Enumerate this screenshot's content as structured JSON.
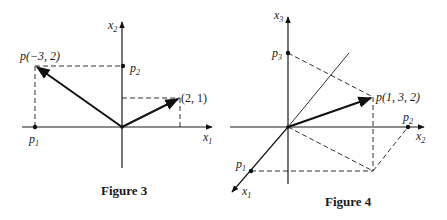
{
  "figure3": {
    "caption": "Figure 3",
    "axes": {
      "horizontal": "x",
      "horizontal_sub": "1",
      "vertical": "x",
      "vertical_sub": "2"
    },
    "points": {
      "p_label": "p(−3, 2)",
      "q_label": "(2, 1)",
      "p1": "p",
      "p1_sub": "1",
      "p2": "p",
      "p2_sub": "2"
    },
    "vectors": [
      {
        "from": [
          0,
          0
        ],
        "to": [
          -3,
          2
        ]
      },
      {
        "from": [
          0,
          0
        ],
        "to": [
          2,
          1
        ]
      }
    ]
  },
  "figure4": {
    "caption": "Figure 4",
    "axes": {
      "x1": "x",
      "x1_sub": "1",
      "x2": "x",
      "x2_sub": "2",
      "x3": "x",
      "x3_sub": "3"
    },
    "points": {
      "p_label": "p(1, 3, 2)",
      "p1": "p",
      "p1_sub": "1",
      "p2": "p",
      "p2_sub": "2",
      "p3": "p",
      "p3_sub": "3"
    },
    "vectors": [
      {
        "from": [
          0,
          0,
          0
        ],
        "to": [
          1,
          3,
          2
        ]
      }
    ]
  }
}
